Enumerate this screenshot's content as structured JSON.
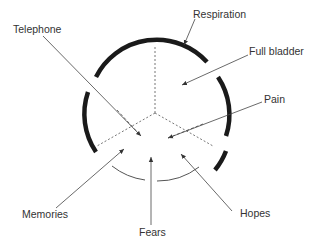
{
  "diagram": {
    "type": "circular-influence-diagram",
    "center": {
      "x": 155,
      "y": 113
    },
    "radius": 68,
    "colors": {
      "thick_arc": "#1a1a1a",
      "thin_arc": "#555555",
      "arrow": "#444444",
      "dotted": "#777777",
      "text": "#333333"
    },
    "labels": {
      "respiration": "Respiration",
      "full_bladder": "Full bladder",
      "pain": "Pain",
      "telephone": "Telephone",
      "memories": "Memories",
      "fears": "Fears",
      "hopes": "Hopes"
    }
  }
}
